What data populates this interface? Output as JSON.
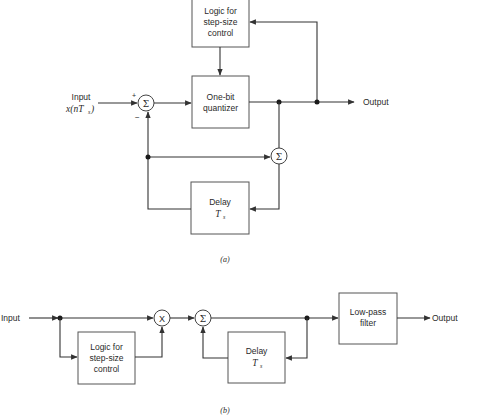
{
  "figure_a": {
    "caption": "(a)",
    "input_label": "Input",
    "input_signal": "x(nT",
    "input_signal_sub": "s",
    "input_signal_close": ")",
    "plus_sign": "+",
    "minus_sign": "−",
    "sum_symbol": "Σ",
    "blocks": {
      "logic": [
        "Logic for",
        "step-size",
        "control"
      ],
      "quantizer": [
        "One-bit",
        "quantizer"
      ],
      "delay": [
        "Delay",
        "T",
        "s"
      ]
    },
    "output_label": "Output"
  },
  "figure_b": {
    "caption": "(b)",
    "input_label": "Input",
    "multiply_symbol": "X",
    "sum_symbol": "Σ",
    "blocks": {
      "logic": [
        "Logic for",
        "step-size",
        "control"
      ],
      "delay": [
        "Delay",
        "T",
        "s"
      ],
      "lowpass": [
        "Low-pass",
        "filter"
      ]
    },
    "output_label": "Output"
  }
}
